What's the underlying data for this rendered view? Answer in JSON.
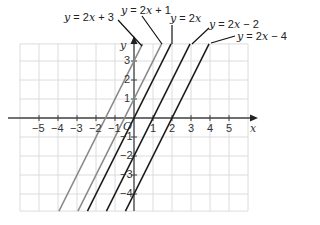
{
  "chart_data": {
    "type": "line",
    "title": "",
    "xlabel": "x",
    "ylabel": "y",
    "origin_label": "O",
    "xlim": [
      -6,
      6
    ],
    "ylim": [
      -4.9,
      3.9
    ],
    "grid": true,
    "x_ticks": [
      -5,
      -4,
      -3,
      -2,
      -1,
      1,
      2,
      3,
      4,
      5
    ],
    "y_ticks": [
      -4,
      -3,
      -2,
      -1,
      1,
      2,
      3
    ],
    "series": [
      {
        "name": "y = 2x + 3",
        "slope": 2,
        "intercept": 3,
        "color": "#8a8a8a"
      },
      {
        "name": "y = 2x + 1",
        "slope": 2,
        "intercept": 1,
        "color": "#8a8a8a"
      },
      {
        "name": "y = 2x",
        "slope": 2,
        "intercept": 0,
        "color": "#1a1a1a"
      },
      {
        "name": "y = 2x − 2",
        "slope": 2,
        "intercept": -2,
        "color": "#1a1a1a"
      },
      {
        "name": "y = 2x − 4",
        "slope": 2,
        "intercept": -4,
        "color": "#1a1a1a"
      }
    ],
    "annotations": [
      {
        "text": "y = 2x + 3",
        "label_x": 64,
        "label_y": 12,
        "leader_from": [
          118,
          20
        ],
        "leader_to": [
          142,
          46
        ]
      },
      {
        "text": "y = 2x + 1",
        "label_x": 121,
        "label_y": 5,
        "leader_from": [
          142,
          16
        ],
        "leader_to": [
          162,
          44
        ]
      },
      {
        "text": "y = 2x",
        "label_x": 170,
        "label_y": 13,
        "leader_from": [
          172,
          25
        ],
        "leader_to": [
          172,
          44
        ]
      },
      {
        "text": "y = 2x − 2",
        "label_x": 209,
        "label_y": 19,
        "leader_from": [
          209,
          28
        ],
        "leader_to": [
          192,
          44
        ]
      },
      {
        "text": "y = 2x − 4",
        "label_x": 237,
        "label_y": 31,
        "leader_from": [
          235,
          36
        ],
        "leader_to": [
          211,
          43
        ]
      }
    ]
  }
}
